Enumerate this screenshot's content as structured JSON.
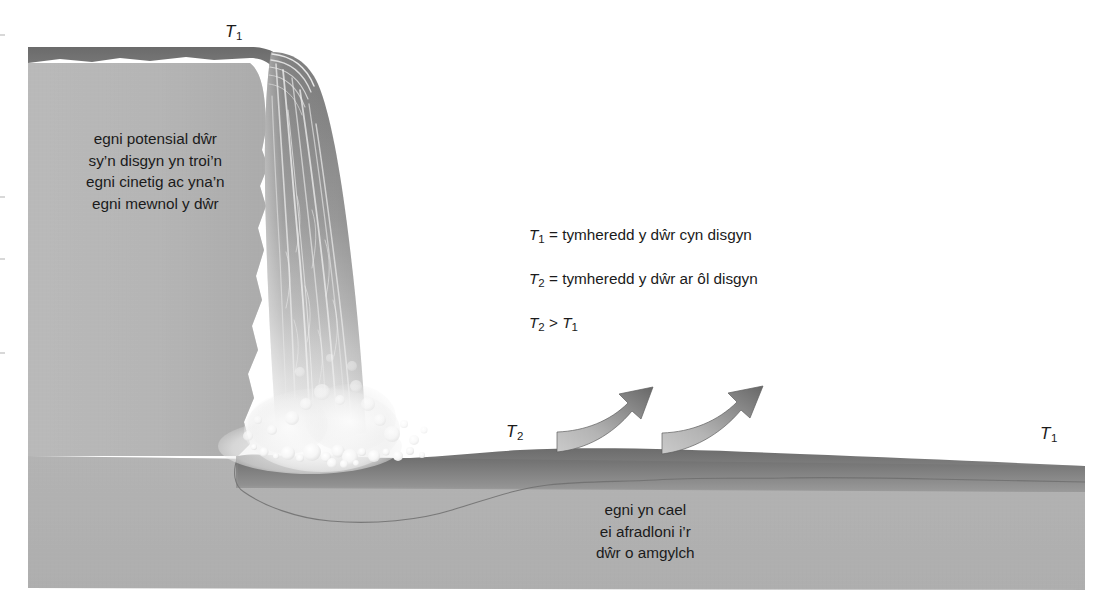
{
  "figure": {
    "title_labels": {
      "t1_top": {
        "symbol": "T",
        "sub": "1"
      },
      "t2_pool": {
        "symbol": "T",
        "sub": "2"
      },
      "t1_right": {
        "symbol": "T",
        "sub": "1"
      }
    },
    "cliff_text": {
      "lines": [
        "egni potensial dŵr",
        "sy’n disgyn yn troi’n",
        "egni cinetig ac yna’n",
        "egni mewnol y dŵr"
      ]
    },
    "dissipation_text": {
      "lines": [
        "egni yn cael",
        "ei afradloni i’r",
        "dŵr o amgylch"
      ]
    },
    "definitions": [
      {
        "symbol": "T",
        "sub": "1",
        "rest": "= tymheredd y dŵr cyn disgyn"
      },
      {
        "symbol": "T",
        "sub": "2",
        "rest": "= tymheredd y dŵr ar ôl disgyn"
      },
      {
        "symbol": "T",
        "sub": "2",
        "rest": ">",
        "symbol2": "T",
        "sub2": "1"
      }
    ],
    "colors": {
      "background": "#ffffff",
      "rock_light": "#b5b5b5",
      "rock_mid": "#a8a8a8",
      "water_dark": "#6e6e6e",
      "water_mid": "#8d8d8d",
      "waterfall_top": "#8a8a8a",
      "waterfall_bottom": "#e8e8e8",
      "foam": "#f2f2f2",
      "arrow_light": "#c2c2c2",
      "arrow_dark": "#6a6a6a",
      "text": "#1b1b1b",
      "outline": "#555555"
    },
    "icons": {
      "arrow_1": "curved-arrow-icon",
      "arrow_2": "curved-arrow-icon"
    }
  }
}
